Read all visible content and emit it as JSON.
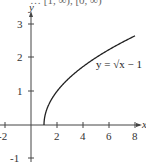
{
  "header": {
    "cropped_text": "… [1, ∞), [0, ∞)"
  },
  "chart_data": {
    "type": "line",
    "title": "",
    "xlabel": "x",
    "ylabel": "y",
    "xlim": [
      -2,
      8
    ],
    "ylim": [
      -1,
      3
    ],
    "x_ticks": [
      "-2",
      "2",
      "4",
      "6",
      "8"
    ],
    "y_ticks": [
      "3",
      "2",
      "1",
      "-1"
    ],
    "grid": false,
    "legend": null,
    "annotations": [
      {
        "text": "y = √x − 1",
        "x": 6.5,
        "y": 1.9
      }
    ],
    "series": [
      {
        "name": "y = sqrt(x - 1)",
        "x": [
          1,
          1.05,
          1.2,
          1.5,
          2,
          3,
          4,
          5,
          6,
          7,
          8
        ],
        "values": [
          0,
          0.224,
          0.447,
          0.707,
          1.0,
          1.414,
          1.732,
          2.0,
          2.236,
          2.449,
          2.646
        ]
      }
    ]
  },
  "labels": {
    "x_axis": "x",
    "y_axis": "y",
    "equation": "y = √x − 1",
    "x_tick_m2": "-2",
    "x_tick_2": "2",
    "x_tick_4": "4",
    "x_tick_6": "6",
    "x_tick_8": "8",
    "y_tick_1": "1",
    "y_tick_2": "2",
    "y_tick_3": "3",
    "y_tick_m1": "-1"
  }
}
